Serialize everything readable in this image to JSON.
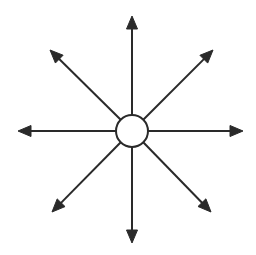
{
  "figure": {
    "name": "radial-arrow-diagram",
    "title": "",
    "caption": "",
    "background_color": "#ffffff",
    "stroke_color": "#2a2a2a",
    "fill_color": "#2a2a2a",
    "stroke_width": 2,
    "width": 256,
    "height": 255
  },
  "hub": {
    "label": "",
    "shape": "circle",
    "center_x": 132,
    "center_y": 131,
    "radius": 16,
    "fill": "#ffffff",
    "stroke": "#2a2a2a",
    "stroke_width": 2
  },
  "arrows": {
    "count": 8,
    "arrowhead_length": 13,
    "arrowhead_width": 11,
    "items": [
      {
        "name": "arrow-north",
        "label": "",
        "direction": "north",
        "angle_deg": 90,
        "start_x": 132,
        "start_y": 115,
        "tip_x": 132,
        "tip_y": 16
      },
      {
        "name": "arrow-northeast",
        "label": "",
        "direction": "northeast",
        "angle_deg": 45,
        "start_x": 143,
        "start_y": 120,
        "tip_x": 213,
        "tip_y": 50
      },
      {
        "name": "arrow-east",
        "label": "",
        "direction": "east",
        "angle_deg": 0,
        "start_x": 148,
        "start_y": 131,
        "tip_x": 243,
        "tip_y": 131
      },
      {
        "name": "arrow-southeast",
        "label": "",
        "direction": "southeast",
        "angle_deg": -45,
        "start_x": 143,
        "start_y": 142,
        "tip_x": 211,
        "tip_y": 212
      },
      {
        "name": "arrow-south",
        "label": "",
        "direction": "south",
        "angle_deg": -90,
        "start_x": 132,
        "start_y": 147,
        "tip_x": 132,
        "tip_y": 243
      },
      {
        "name": "arrow-southwest",
        "label": "",
        "direction": "southwest",
        "angle_deg": -135,
        "start_x": 121,
        "start_y": 142,
        "tip_x": 52,
        "tip_y": 212
      },
      {
        "name": "arrow-west",
        "label": "",
        "direction": "west",
        "angle_deg": 180,
        "start_x": 116,
        "start_y": 131,
        "tip_x": 18,
        "tip_y": 131
      },
      {
        "name": "arrow-northwest",
        "label": "",
        "direction": "northwest",
        "angle_deg": 135,
        "start_x": 121,
        "start_y": 120,
        "tip_x": 50,
        "tip_y": 50
      }
    ]
  }
}
